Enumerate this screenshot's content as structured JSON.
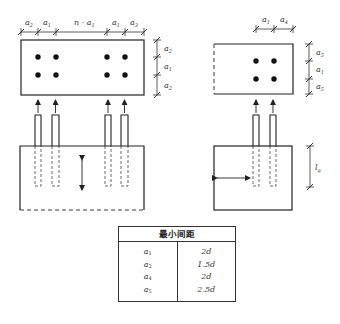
{
  "diagram": {
    "top_left_view": {
      "horizontal_dims": [
        "a2",
        "a1",
        "n·a1",
        "a1",
        "a3"
      ],
      "vertical_dims": [
        "a2",
        "a1",
        "a2"
      ],
      "bolt_rows": 2,
      "bolt_cols": 4
    },
    "top_right_view": {
      "horizontal_dims": [
        "a1",
        "a4"
      ],
      "vertical_dims": [
        "a5",
        "a1",
        "a5"
      ],
      "bolt_rows": 2,
      "bolt_cols": 2
    },
    "bottom_right_view": {
      "vertical_dim": "lg"
    }
  },
  "labels": {
    "h_a2": {
      "base": "a",
      "sub": "2"
    },
    "h_a1a": {
      "base": "a",
      "sub": "1"
    },
    "h_na1": {
      "base": "n · a",
      "sub": "1"
    },
    "h_a1b": {
      "base": "a",
      "sub": "1"
    },
    "h_a3": {
      "base": "a",
      "sub": "3"
    },
    "v_a2a": {
      "base": "a",
      "sub": "2"
    },
    "v_a1": {
      "base": "a",
      "sub": "1"
    },
    "v_a2b": {
      "base": "a",
      "sub": "2"
    },
    "r_h_a1": {
      "base": "a",
      "sub": "1"
    },
    "r_h_a4": {
      "base": "a",
      "sub": "4"
    },
    "r_v_a5a": {
      "base": "a",
      "sub": "5"
    },
    "r_v_a1": {
      "base": "a",
      "sub": "1"
    },
    "r_v_a5b": {
      "base": "a",
      "sub": "5"
    },
    "lg": {
      "base": "l",
      "sub": "g"
    }
  },
  "table": {
    "header": "最小间距",
    "rows": [
      {
        "sym": "a",
        "sub": "1",
        "value": "2d"
      },
      {
        "sym": "a",
        "sub": "2",
        "value": "1.5d"
      },
      {
        "sym": "a",
        "sub": "4",
        "value": "2d"
      },
      {
        "sym": "a",
        "sub": "5",
        "value": "2.5d"
      }
    ]
  }
}
